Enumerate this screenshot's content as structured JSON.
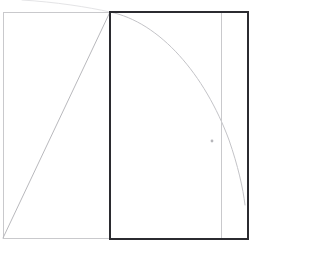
{
  "figure": {
    "title": "",
    "type": "line-drawing",
    "canvas": {
      "width": 311,
      "height": 254,
      "background_color": "#ffffff"
    },
    "colors": {
      "background": "#ffffff",
      "dark_stroke": "#2b2b30",
      "light_stroke": "#c9c9cc",
      "faint_stroke": "#e2e2e4",
      "marker": "#b6b6ba"
    },
    "shapes": [
      {
        "name": "left-light-rectangle",
        "kind": "rect",
        "x": 3,
        "y": 12,
        "width": 107,
        "height": 226,
        "stroke": "#c9c9cc",
        "stroke_width": 1,
        "fill": "none"
      },
      {
        "name": "main-dark-rectangle",
        "kind": "rect",
        "x": 110,
        "y": 12,
        "width": 138,
        "height": 227,
        "stroke": "#2b2b30",
        "stroke_width": 2,
        "fill": "none"
      },
      {
        "name": "inner-vertical-divider",
        "kind": "line",
        "x1": 221,
        "y1": 13,
        "x2": 221,
        "y2": 238,
        "stroke": "#c9c9cc",
        "stroke_width": 1
      },
      {
        "name": "diagonal-hypotenuse",
        "kind": "line",
        "x1": 3,
        "y1": 238,
        "x2": 110,
        "y2": 12,
        "stroke": "#b9b9bd",
        "stroke_width": 1
      },
      {
        "name": "arc-curve",
        "kind": "path",
        "d": "M 110 12 C 160 22, 205 75, 229 140 C 238 166, 243 188, 245 205",
        "stroke": "#c4c4c8",
        "stroke_width": 1,
        "fill": "none"
      },
      {
        "name": "arc-curve-faint-extension",
        "kind": "path",
        "d": "M 110 12 C 88 7, 55 2, 22 0",
        "stroke": "#e4e4e6",
        "stroke_width": 1,
        "fill": "none"
      },
      {
        "name": "point-marker",
        "kind": "dot",
        "cx": 212,
        "cy": 141,
        "r": 1.4,
        "fill": "#b6b6ba"
      }
    ],
    "labels": []
  },
  "chart_data": {
    "type": "line",
    "title": "",
    "xlabel": "",
    "ylabel": "",
    "grid": false,
    "legend": "none",
    "xlim": [
      0,
      311
    ],
    "ylim": [
      0,
      254
    ],
    "series": [
      {
        "name": "diagonal-hypotenuse",
        "kind": "line",
        "x": [
          3,
          110
        ],
        "y": [
          238,
          12
        ]
      },
      {
        "name": "arc-curve",
        "kind": "curve",
        "x": [
          110,
          140,
          170,
          200,
          221,
          235,
          245
        ],
        "y": [
          12,
          33,
          66,
          108,
          130,
          168,
          205
        ]
      },
      {
        "name": "point-marker",
        "kind": "scatter",
        "x": [
          212
        ],
        "y": [
          141
        ]
      }
    ],
    "annotations": []
  }
}
